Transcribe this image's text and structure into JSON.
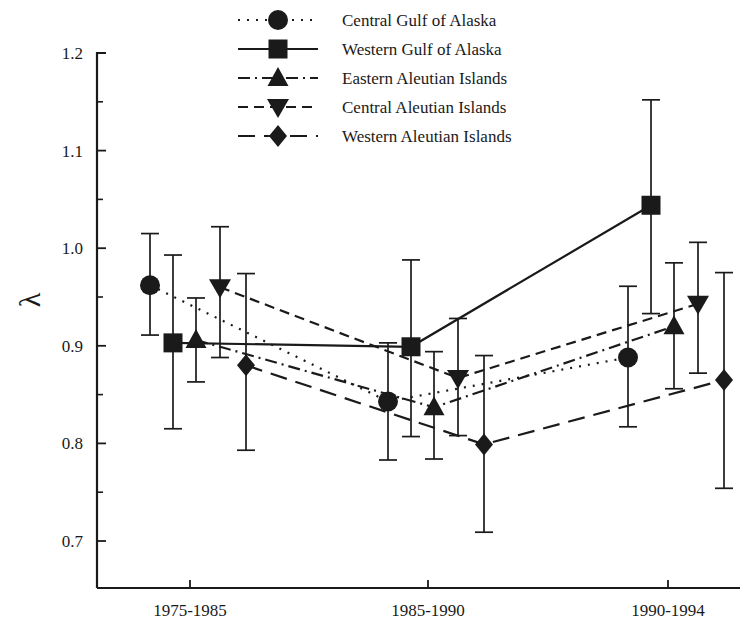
{
  "chart_data": {
    "type": "line",
    "title": "",
    "xlabel": "",
    "ylabel": "λ",
    "categories": [
      "1975-1985",
      "1985-1990",
      "1990-1994"
    ],
    "ylim": [
      0.65,
      1.2
    ],
    "yticks": [
      "0.7",
      "0.8",
      "0.9",
      "1.0",
      "1.1",
      "1.2"
    ],
    "ytick_values": [
      0.7,
      0.8,
      0.9,
      1.0,
      1.1,
      1.2
    ],
    "minor_tick_step": 0.05,
    "grid": false,
    "legend_position": "top-center",
    "error_bars": "vertical",
    "series": [
      {
        "name": "Central Gulf of Alaska",
        "marker": "circle",
        "line_style": "dotted",
        "values": [
          0.962,
          0.843,
          0.888
        ],
        "err_low": [
          0.911,
          0.783,
          0.817
        ],
        "err_high": [
          1.015,
          0.903,
          0.961
        ]
      },
      {
        "name": "Western Gulf of Alaska",
        "marker": "square",
        "line_style": "solid",
        "values": [
          0.903,
          0.899,
          1.044
        ],
        "err_low": [
          0.815,
          0.807,
          0.933
        ],
        "err_high": [
          0.993,
          0.988,
          1.152
        ]
      },
      {
        "name": "Eastern Aleutian Islands",
        "marker": "triangle-up",
        "line_style": "dash-dot",
        "values": [
          0.906,
          0.837,
          0.92
        ],
        "err_low": [
          0.863,
          0.784,
          0.856
        ],
        "err_high": [
          0.949,
          0.894,
          0.985
        ]
      },
      {
        "name": "Central Aleutian Islands",
        "marker": "triangle-down",
        "line_style": "dashed",
        "values": [
          0.96,
          0.867,
          0.943
        ],
        "err_low": [
          0.888,
          0.808,
          0.872
        ],
        "err_high": [
          1.022,
          0.928,
          1.006
        ]
      },
      {
        "name": "Western Aleutian Islands",
        "marker": "diamond",
        "line_style": "long-dash",
        "values": [
          0.88,
          0.799,
          0.865
        ],
        "err_low": [
          0.793,
          0.709,
          0.754
        ],
        "err_high": [
          0.974,
          0.89,
          0.975
        ]
      }
    ]
  },
  "legend": {
    "items": [
      {
        "label": "Central Gulf of Alaska"
      },
      {
        "label": "Western Gulf of Alaska"
      },
      {
        "label": "Eastern Aleutian Islands"
      },
      {
        "label": "Central Aleutian Islands"
      },
      {
        "label": "Western Aleutian Islands"
      }
    ]
  },
  "axes": {
    "y_label": "λ",
    "y_tick_labels": [
      "1.2",
      "1.1",
      "1.0",
      "0.9",
      "0.8",
      "0.7"
    ],
    "x_tick_labels": [
      "1975-1985",
      "1985-1990",
      "1990-1994"
    ]
  },
  "colors": {
    "ink": "#1a1a1a",
    "background": "#ffffff"
  }
}
